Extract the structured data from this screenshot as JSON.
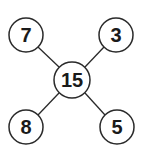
{
  "diagram": {
    "center": {
      "label": "15",
      "cx": 72,
      "cy": 80,
      "r": 18
    },
    "nodes": [
      {
        "id": "top-left",
        "label": "7",
        "cx": 26,
        "cy": 35,
        "r": 17
      },
      {
        "id": "top-right",
        "label": "3",
        "cx": 116,
        "cy": 35,
        "r": 17
      },
      {
        "id": "bottom-left",
        "label": "8",
        "cx": 26,
        "cy": 127,
        "r": 17
      },
      {
        "id": "bottom-right",
        "label": "5",
        "cx": 117,
        "cy": 127,
        "r": 17
      }
    ],
    "colors": {
      "stroke": "#2a2a2a",
      "fill": "#ffffff",
      "text": "#1a1a1a"
    }
  }
}
